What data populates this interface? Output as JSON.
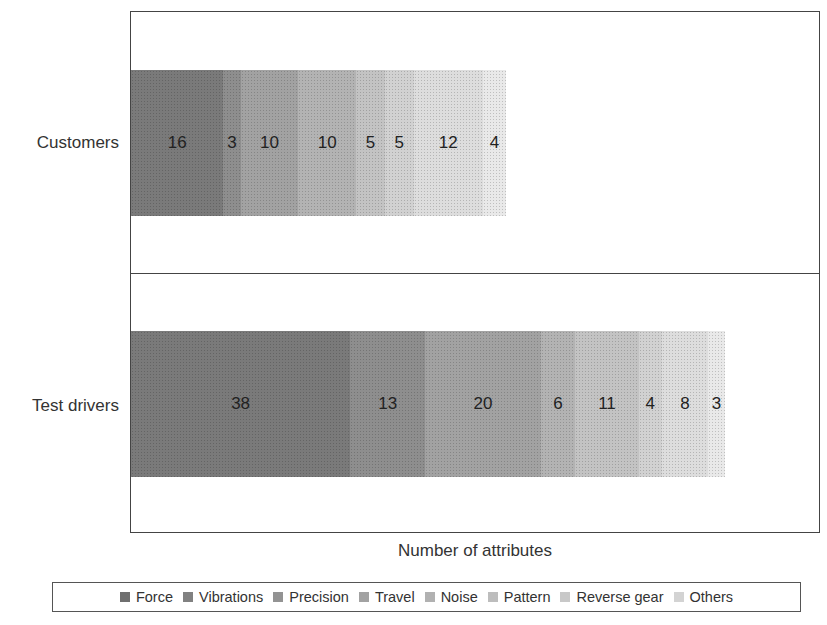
{
  "chart_data": {
    "type": "bar",
    "orientation": "horizontal",
    "stacked": true,
    "title": "",
    "xlabel": "Number of attributes",
    "ylabel": "",
    "categories": [
      "Customers",
      "Test drivers"
    ],
    "series": [
      {
        "name": "Force",
        "values": [
          16,
          38
        ],
        "color": "#7a7a7a"
      },
      {
        "name": "Vibrations",
        "values": [
          3,
          13
        ],
        "color": "#8e8e8e"
      },
      {
        "name": "Precision",
        "values": [
          10,
          20
        ],
        "color": "#a2a2a2"
      },
      {
        "name": "Travel",
        "values": [
          10,
          6
        ],
        "color": "#b3b3b3"
      },
      {
        "name": "Noise",
        "values": [
          5,
          11
        ],
        "color": "#c3c3c3"
      },
      {
        "name": "Pattern",
        "values": [
          5,
          4
        ],
        "color": "#d1d1d1"
      },
      {
        "name": "Reverse gear",
        "values": [
          12,
          8
        ],
        "color": "#dddddd"
      },
      {
        "name": "Others",
        "values": [
          4,
          3
        ],
        "color": "#e9e9e9"
      }
    ],
    "xlim": [
      0,
      119.5
    ],
    "grid": false,
    "legend_position": "bottom",
    "data_labels": true
  },
  "labels": {
    "xlabel": "Number of attributes",
    "categories": [
      "Customers",
      "Test drivers"
    ],
    "legend": [
      "Force",
      "Vibrations",
      "Precision",
      "Travel",
      "Noise",
      "Pattern",
      "Reverse gear",
      "Others"
    ]
  }
}
